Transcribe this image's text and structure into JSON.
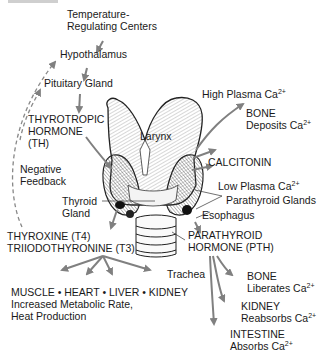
{
  "diagram": {
    "colors": {
      "arrow": "#808080",
      "text": "#1a1a1a",
      "outline": "#222222"
    },
    "labels": {
      "temp_centers_1": "Temperature-",
      "temp_centers_2": "Regulating Centers",
      "hypothalamus": "Hypothalamus",
      "pituitary": "Pituitary Gland",
      "th_1": "THYROTROPIC",
      "th_2": "HORMONE",
      "th_3": "(TH)",
      "negative_1": "Negative",
      "negative_2": "Feedback",
      "thyroid_1": "Thyroid",
      "thyroid_2": "Gland",
      "t4": "THYROXINE (T4)",
      "t3": "TRIIODOTHYRONINE (T3)",
      "targets": "MUSCLE • HEART • LIVER • KIDNEY",
      "effect_1": "Increased Metabolic Rate,",
      "effect_2": "Heat Production",
      "larynx": "Larynx",
      "high_ca": "High Plasma Ca",
      "bone_dep_1": "BONE",
      "bone_dep_2": "Deposits Ca",
      "calcitonin": "CALCITONIN",
      "low_ca": "Low Plasma Ca",
      "parathyroid": "Parathyroid Glands",
      "esophagus": "Esophagus",
      "pth_1": "PARATHYROID",
      "pth_2": "HORMONE (PTH)",
      "trachea": "Trachea",
      "bone_lib_1": "BONE",
      "bone_lib_2": "Liberates Ca",
      "kidney_1": "KIDNEY",
      "kidney_2": "Reabsorbs Ca",
      "intestine_1": "INTESTINE",
      "intestine_2": "Absorbs Ca",
      "ion_charge": "2+"
    }
  }
}
